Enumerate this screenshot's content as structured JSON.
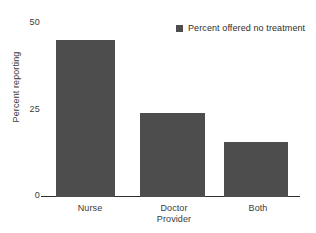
{
  "chart_data": {
    "type": "bar",
    "title": "",
    "subtitle": "",
    "categories": [
      "Nurse",
      "Doctor",
      "Both"
    ],
    "values": [
      43,
      23,
      15
    ],
    "series": [
      {
        "name": "Percent offered no treatment",
        "values": [
          43,
          23,
          15
        ],
        "color": "#4d4d4d"
      }
    ],
    "xlabel": "Provider",
    "ylabel": "Percent reporting",
    "ylim": [
      0,
      50
    ],
    "yticks": [
      0,
      25,
      50
    ],
    "ytick_labels": [
      "0",
      "25",
      "50"
    ],
    "xtick_labels": [
      "Nurse",
      "Doctor",
      "Both"
    ],
    "grid": false,
    "legend": {
      "position": "top-right",
      "entries": [
        {
          "label": "Percent offered no treatment",
          "color": "#4d4d4d",
          "marker": "square"
        }
      ]
    },
    "annotations": [],
    "colors": {
      "bar": "#4d4d4d",
      "axis": "#2e2e2e",
      "text": "#3a3a3a",
      "background": "#ffffff"
    }
  }
}
